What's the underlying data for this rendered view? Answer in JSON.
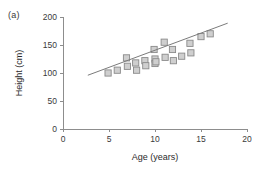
{
  "figure": {
    "panel_label": "(a)",
    "background_color": "#ffffff"
  },
  "chart_data": {
    "type": "scatter",
    "title": "",
    "xlabel": "Age (years)",
    "ylabel": "Height (cm)",
    "xlim": [
      0,
      20
    ],
    "ylim": [
      0,
      200
    ],
    "xticks": [
      0,
      5,
      10,
      15,
      20
    ],
    "yticks": [
      0,
      50,
      100,
      150,
      200
    ],
    "xticklabels": [
      "0",
      "5",
      "10",
      "15",
      "20"
    ],
    "yticklabels": [
      "0",
      "50",
      "100",
      "150",
      "200"
    ],
    "grid": false,
    "legend": false,
    "marker_style": "square",
    "marker_fill": "#cfcfcf",
    "marker_edge": "#8a8a8a",
    "points": [
      {
        "x": 4.9,
        "y": 100
      },
      {
        "x": 5.9,
        "y": 105
      },
      {
        "x": 6.9,
        "y": 127
      },
      {
        "x": 7.0,
        "y": 112
      },
      {
        "x": 7.9,
        "y": 118
      },
      {
        "x": 8.0,
        "y": 105
      },
      {
        "x": 8.9,
        "y": 122
      },
      {
        "x": 9.0,
        "y": 113
      },
      {
        "x": 9.9,
        "y": 142
      },
      {
        "x": 10.0,
        "y": 125
      },
      {
        "x": 10.0,
        "y": 117
      },
      {
        "x": 10.1,
        "y": 120
      },
      {
        "x": 11.0,
        "y": 155
      },
      {
        "x": 11.1,
        "y": 128
      },
      {
        "x": 11.9,
        "y": 142
      },
      {
        "x": 12.0,
        "y": 122
      },
      {
        "x": 12.9,
        "y": 130
      },
      {
        "x": 13.8,
        "y": 153
      },
      {
        "x": 13.9,
        "y": 136
      },
      {
        "x": 15.0,
        "y": 165
      },
      {
        "x": 16.0,
        "y": 170
      }
    ],
    "trendline": {
      "type": "line",
      "x_start": 2.7,
      "y_start": 96,
      "x_end": 17.9,
      "y_end": 189,
      "color": "#7b7b7b"
    }
  }
}
